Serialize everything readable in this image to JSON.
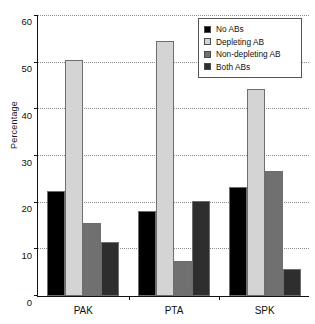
{
  "chart_data": {
    "type": "bar",
    "title": "",
    "xlabel": "",
    "ylabel": "Percentage",
    "ylim": [
      0,
      60
    ],
    "yticks": [
      0,
      10,
      20,
      30,
      40,
      50,
      60
    ],
    "grid": true,
    "legend_position": "top-right",
    "categories": [
      "PAK",
      "PTA",
      "SPK"
    ],
    "series": [
      {
        "name": "No ABs",
        "color": "#000000",
        "values": [
          22.5,
          18.2,
          23.3
        ]
      },
      {
        "name": "Depleting AB",
        "color": "#d4d4d4",
        "values": [
          50.3,
          54.5,
          44.3
        ]
      },
      {
        "name": "Non-depleting AB",
        "color": "#707070",
        "values": [
          15.6,
          7.5,
          26.8
        ]
      },
      {
        "name": "Both ABs",
        "color": "#2e2e2e",
        "values": [
          11.6,
          20.2,
          5.8
        ]
      }
    ]
  },
  "legend": {
    "items": [
      {
        "label": "No ABs",
        "color": "#000000"
      },
      {
        "label": "Depleting AB",
        "color": "#d4d4d4"
      },
      {
        "label": "Non-depleting AB",
        "color": "#707070"
      },
      {
        "label": "Both ABs",
        "color": "#2e2e2e"
      }
    ]
  }
}
